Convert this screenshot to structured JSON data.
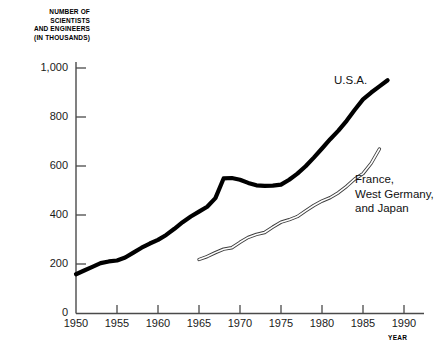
{
  "chart_data": {
    "type": "line",
    "title": "",
    "subtitle": "",
    "ylabel_lines": [
      "NUMBER OF",
      "SCIENTISTS",
      "AND ENGINEERS",
      "(IN THOUSANDS)"
    ],
    "ylabel": "NUMBER OF SCIENTISTS AND ENGINEERS (IN THOUSANDS)",
    "xlabel": "YEAR",
    "xlim": [
      1950,
      1990
    ],
    "ylim": [
      0,
      1000
    ],
    "yticks": [
      0,
      200,
      400,
      600,
      800,
      1000
    ],
    "ytick_labels": [
      "0",
      "200",
      "400",
      "600",
      "800",
      "1,000"
    ],
    "xticks": [
      1950,
      1955,
      1960,
      1965,
      1970,
      1975,
      1980,
      1985,
      1990
    ],
    "xtick_labels": [
      "1950",
      "1955",
      "1960",
      "1965",
      "1970",
      "1975",
      "1980",
      "1985",
      "1990"
    ],
    "grid": false,
    "legend_position": "inline-annotations",
    "series": [
      {
        "name": "U.S.A.",
        "label": "U.S.A.",
        "style": "thick-solid-black",
        "color": "#000000",
        "x": [
          1950,
          1951,
          1952,
          1953,
          1954,
          1955,
          1956,
          1957,
          1958,
          1959,
          1960,
          1961,
          1962,
          1963,
          1964,
          1965,
          1966,
          1967,
          1968,
          1969,
          1970,
          1971,
          1972,
          1973,
          1974,
          1975,
          1976,
          1977,
          1978,
          1979,
          1980,
          1981,
          1982,
          1983,
          1984,
          1985,
          1986,
          1987,
          1988
        ],
        "values": [
          160,
          175,
          190,
          205,
          212,
          216,
          228,
          248,
          268,
          285,
          300,
          320,
          345,
          372,
          395,
          415,
          435,
          470,
          550,
          552,
          545,
          532,
          522,
          520,
          521,
          525,
          545,
          570,
          600,
          635,
          672,
          710,
          745,
          785,
          830,
          872,
          900,
          925,
          950
        ]
      },
      {
        "name": "France, West Germany, and Japan",
        "label_lines": [
          "France,",
          "West Germany,",
          "and Japan"
        ],
        "style": "thin-outline-double",
        "color": "#4a4a4a",
        "x": [
          1965,
          1966,
          1967,
          1968,
          1969,
          1970,
          1971,
          1972,
          1973,
          1974,
          1975,
          1976,
          1977,
          1978,
          1979,
          1980,
          1981,
          1982,
          1983,
          1984,
          1985,
          1986,
          1987
        ],
        "values": [
          220,
          232,
          248,
          262,
          268,
          290,
          310,
          322,
          330,
          352,
          372,
          382,
          395,
          418,
          440,
          458,
          472,
          492,
          518,
          548,
          570,
          612,
          670
        ]
      }
    ]
  },
  "labels": {
    "usa": "U.S.A.",
    "others_line1": "France,",
    "others_line2": "West Germany,",
    "others_line3": "and Japan",
    "year_axis": "YEAR"
  }
}
